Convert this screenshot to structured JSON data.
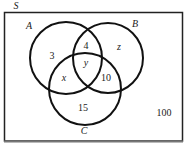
{
  "diagram": {
    "type": "venn-3-set",
    "universe": {
      "label": "S",
      "outside_value": "100"
    },
    "sets": [
      {
        "label": "A"
      },
      {
        "label": "B"
      },
      {
        "label": "C"
      }
    ],
    "regions": {
      "A_only": "3",
      "A_and_B_only": "4",
      "A_and_B_and_C": "y",
      "B_only": "z",
      "A_and_C_only": "x",
      "B_and_C_only": "10",
      "C_only": "15"
    },
    "colors": {
      "stroke": "#111111",
      "background": "#ffffff",
      "text": "#222222"
    }
  }
}
